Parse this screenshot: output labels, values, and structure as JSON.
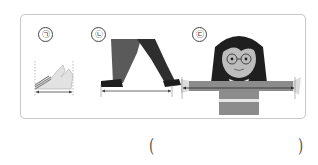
{
  "question": {
    "items": [
      {
        "label": "㉠",
        "description": "hand span measured between finger tips"
      },
      {
        "label": "㉡",
        "description": "walking step length measured between feet"
      },
      {
        "label": "㉢",
        "description": "arm span measured between fingertips of outstretched arms"
      }
    ],
    "answer": {
      "open_paren": "(",
      "value": "",
      "close_paren": ")"
    }
  },
  "colors": {
    "card_border": "#c9c9c9",
    "figure_dark": "#2a2a2a",
    "figure_gray": "#8a8a8a",
    "figure_light": "#d6d6d6",
    "arrow": "#444444"
  }
}
